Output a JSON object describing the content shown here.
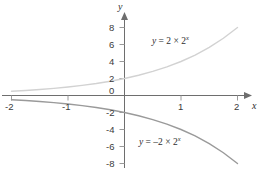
{
  "chart_data": {
    "type": "line",
    "title": "",
    "xlabel": "x",
    "ylabel": "y",
    "xlim": [
      -2,
      2.2
    ],
    "ylim": [
      -8.6,
      8.8
    ],
    "grid": false,
    "legend_position": "inline-annotations",
    "x_ticks": [
      "-2",
      "-1",
      "1",
      "2"
    ],
    "x_tick_values": [
      -2,
      -1,
      1,
      2
    ],
    "y_ticks": [
      "8",
      "6",
      "4",
      "2",
      "0",
      "-2",
      "-4",
      "-6",
      "-8"
    ],
    "y_tick_values": [
      8,
      6,
      4,
      2,
      0,
      -2,
      -4,
      -6,
      -8
    ],
    "series": [
      {
        "name": "y = 2 × 2ˣ",
        "color": "#d2d2d2",
        "x": [
          -2,
          -1.75,
          -1.5,
          -1.25,
          -1,
          -0.75,
          -0.5,
          -0.25,
          0,
          0.25,
          0.5,
          0.75,
          1,
          1.25,
          1.5,
          1.75,
          2
        ],
        "values": [
          0.5,
          0.59,
          0.71,
          0.84,
          1,
          1.19,
          1.41,
          1.68,
          2,
          2.38,
          2.83,
          3.36,
          4,
          4.76,
          5.66,
          6.73,
          8
        ]
      },
      {
        "name": "y = -2 × 2ˣ",
        "color": "#9a9a9a",
        "x": [
          -2,
          -1.75,
          -1.5,
          -1.25,
          -1,
          -0.75,
          -0.5,
          -0.25,
          0,
          0.25,
          0.5,
          0.75,
          1,
          1.25,
          1.5,
          1.75,
          2
        ],
        "values": [
          -0.5,
          -0.59,
          -0.71,
          -0.84,
          -1,
          -1.19,
          -1.41,
          -1.68,
          -2,
          -2.38,
          -2.83,
          -3.36,
          -4,
          -4.76,
          -5.66,
          -6.73,
          -8
        ]
      }
    ],
    "annotations": [
      {
        "id": "upper-curve-label",
        "prefix": "y",
        "equals": " = 2 × 2",
        "exponent": "x",
        "full_text": "y = 2 × 2ˣ"
      },
      {
        "id": "lower-curve-label",
        "prefix": "y",
        "equals": " = –2 × 2",
        "exponent": "x",
        "full_text": "y = –2 × 2ˣ"
      }
    ]
  },
  "axes": {
    "x_axis_name": "x",
    "y_axis_name": "y",
    "axis_color": "#6e6e6e",
    "tick_color": "#9a9a9a",
    "label_color": "#3a3a3a"
  }
}
